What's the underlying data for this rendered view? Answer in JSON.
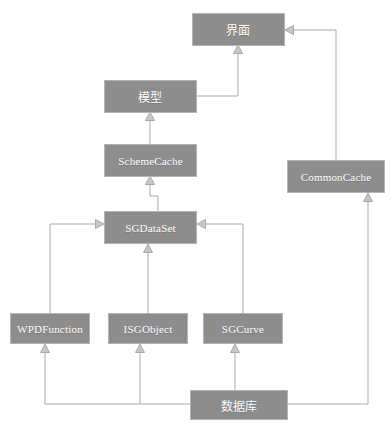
{
  "diagram": {
    "type": "class-hierarchy",
    "title": "",
    "background_color": "#ffffff",
    "node_fill_color": "#8d8d8d",
    "node_border_color": "#b4b4b4",
    "node_text_color": "#ffffff",
    "edge_color": "#a9a9a9",
    "arrowhead_style": "hollow-triangle-generalization",
    "nodes": [
      {
        "id": "ui",
        "label": "界面",
        "script": "cjk",
        "x": 192,
        "y": 13,
        "w": 93,
        "h": 33
      },
      {
        "id": "model",
        "label": "模型",
        "script": "cjk",
        "x": 104,
        "y": 80,
        "w": 93,
        "h": 33
      },
      {
        "id": "schemecache",
        "label": "SchemeCache",
        "script": "latin",
        "x": 104,
        "y": 144,
        "w": 93,
        "h": 33
      },
      {
        "id": "sgdataset",
        "label": "SGDataSet",
        "script": "latin",
        "x": 104,
        "y": 211,
        "w": 93,
        "h": 33
      },
      {
        "id": "commoncache",
        "label": "CommonCache",
        "script": "latin",
        "x": 287,
        "y": 160,
        "w": 98,
        "h": 33
      },
      {
        "id": "wpdfunction",
        "label": "WPDFunction",
        "script": "latin",
        "x": 10,
        "y": 313,
        "w": 80,
        "h": 31
      },
      {
        "id": "isgobject",
        "label": "ISGObject",
        "script": "latin",
        "x": 108,
        "y": 313,
        "w": 80,
        "h": 31
      },
      {
        "id": "sgcurve",
        "label": "SGCurve",
        "script": "latin",
        "x": 203,
        "y": 313,
        "w": 80,
        "h": 31
      },
      {
        "id": "database",
        "label": "数据库",
        "script": "cjk",
        "x": 190,
        "y": 390,
        "w": 98,
        "h": 30
      }
    ],
    "edges": [
      {
        "from": "model",
        "to": "ui",
        "relation": "generalization",
        "routing": "orthogonal"
      },
      {
        "from": "schemecache",
        "to": "model",
        "relation": "generalization",
        "routing": "vertical"
      },
      {
        "from": "sgdataset",
        "to": "schemecache",
        "relation": "generalization",
        "routing": "orthogonal"
      },
      {
        "from": "isgobject",
        "to": "sgdataset",
        "relation": "generalization",
        "routing": "vertical"
      },
      {
        "from": "wpdfunction",
        "to": "sgdataset",
        "relation": "generalization",
        "routing": "orthogonal"
      },
      {
        "from": "sgcurve",
        "to": "sgdataset",
        "relation": "generalization",
        "routing": "orthogonal"
      },
      {
        "from": "commoncache",
        "to": "ui",
        "relation": "generalization",
        "routing": "orthogonal"
      },
      {
        "from": "database",
        "to": "commoncache",
        "relation": "generalization",
        "routing": "orthogonal"
      },
      {
        "from": "database",
        "to": "sgcurve",
        "relation": "generalization",
        "routing": "vertical"
      },
      {
        "from": "database",
        "to": "isgobject",
        "relation": "generalization",
        "routing": "orthogonal"
      },
      {
        "from": "database",
        "to": "wpdfunction",
        "relation": "generalization",
        "routing": "orthogonal"
      }
    ]
  }
}
